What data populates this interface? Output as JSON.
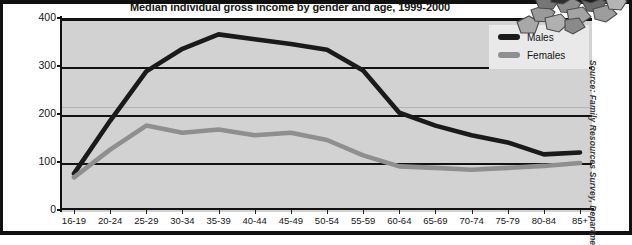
{
  "figure": {
    "title": "Median individual gross income by gender and age, 1999-2000",
    "source_note": "Source: Family Resources Survey, Department for Work and Pensions",
    "plot_background_color": "#d2d2d2",
    "page_background_color": "#ffffff",
    "frame_color": "#111111",
    "decoration_icon": "stone-cluster-icon"
  },
  "legend": {
    "position": "top-right",
    "entries": [
      {
        "label": "Males",
        "color": "#1a1a1a"
      },
      {
        "label": "Females",
        "color": "#8f8f8f"
      }
    ]
  },
  "chart_data": {
    "type": "line",
    "title": "Median individual gross income by gender and age, 1999-2000",
    "xlabel": "",
    "ylabel": "",
    "ylim": [
      0,
      400
    ],
    "yticks": [
      0,
      100,
      200,
      300,
      400
    ],
    "grid": true,
    "grid_axis": "y",
    "legend_position": "top-right",
    "categories": [
      "16-19",
      "20-24",
      "25-29",
      "30-34",
      "35-39",
      "40-44",
      "45-49",
      "50-54",
      "55-59",
      "60-64",
      "65-69",
      "70-74",
      "75-79",
      "80-84",
      "85+"
    ],
    "series": [
      {
        "name": "Males",
        "color": "#1a1a1a",
        "values": [
          80,
          190,
          293,
          340,
          370,
          360,
          350,
          338,
          295,
          207,
          180,
          160,
          145,
          120,
          124
        ]
      },
      {
        "name": "Females",
        "color": "#8f8f8f",
        "values": [
          72,
          130,
          180,
          165,
          172,
          160,
          165,
          150,
          118,
          95,
          92,
          88,
          92,
          96,
          102
        ]
      }
    ]
  }
}
